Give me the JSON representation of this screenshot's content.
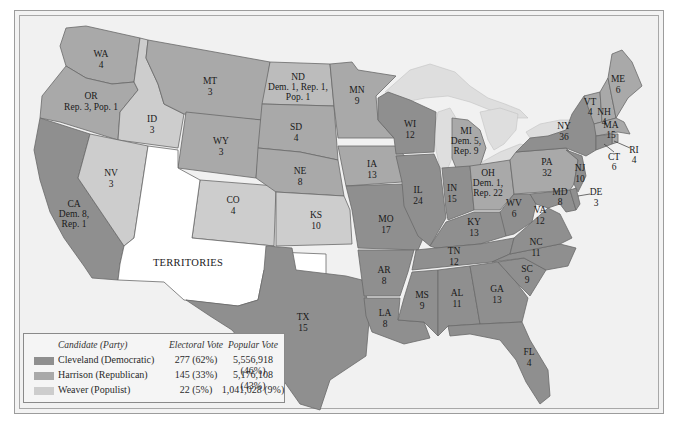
{
  "map": {
    "title": "",
    "territories_label": "TERRITORIES",
    "colors": {
      "democratic": "#8f8f8f",
      "republican": "#a9a9a9",
      "populist": "#cdcdcd",
      "territories": "#ffffff"
    },
    "states": {
      "WA": {
        "abbr": "WA",
        "votes": "4",
        "party": "republican"
      },
      "OR": {
        "abbr": "OR",
        "votes": "Rep. 3, Pop. 1",
        "party": "republican"
      },
      "CA": {
        "abbr": "CA",
        "votes_line1": "Dem. 8,",
        "votes_line2": "Rep. 1",
        "party": "democratic"
      },
      "ID": {
        "abbr": "ID",
        "votes": "3",
        "party": "populist"
      },
      "NV": {
        "abbr": "NV",
        "votes": "3",
        "party": "populist"
      },
      "MT": {
        "abbr": "MT",
        "votes": "3",
        "party": "republican"
      },
      "WY": {
        "abbr": "WY",
        "votes": "3",
        "party": "republican"
      },
      "CO": {
        "abbr": "CO",
        "votes": "4",
        "party": "populist"
      },
      "ND": {
        "abbr": "ND",
        "votes_line1": "Dem. 1, Rep. 1,",
        "votes_line2": "Pop. 1",
        "party": "mixed"
      },
      "SD": {
        "abbr": "SD",
        "votes": "4",
        "party": "republican"
      },
      "NE": {
        "abbr": "NE",
        "votes": "8",
        "party": "republican"
      },
      "KS": {
        "abbr": "KS",
        "votes": "10",
        "party": "populist"
      },
      "TX": {
        "abbr": "TX",
        "votes": "15",
        "party": "democratic"
      },
      "MN": {
        "abbr": "MN",
        "votes": "9",
        "party": "republican"
      },
      "IA": {
        "abbr": "IA",
        "votes": "13",
        "party": "republican"
      },
      "MO": {
        "abbr": "MO",
        "votes": "17",
        "party": "democratic"
      },
      "AR": {
        "abbr": "AR",
        "votes": "8",
        "party": "democratic"
      },
      "LA": {
        "abbr": "LA",
        "votes": "8",
        "party": "democratic"
      },
      "WI": {
        "abbr": "WI",
        "votes": "12",
        "party": "democratic"
      },
      "IL": {
        "abbr": "IL",
        "votes": "24",
        "party": "democratic"
      },
      "MI": {
        "abbr": "MI",
        "votes_line1": "Dem. 5,",
        "votes_line2": "Rep. 9",
        "party": "republican"
      },
      "IN": {
        "abbr": "IN",
        "votes": "15",
        "party": "democratic"
      },
      "OH": {
        "abbr": "OH",
        "votes_line1": "Dem. 1,",
        "votes_line2": "Rep. 22",
        "party": "republican"
      },
      "KY": {
        "abbr": "KY",
        "votes": "13",
        "party": "democratic"
      },
      "TN": {
        "abbr": "TN",
        "votes": "12",
        "party": "democratic"
      },
      "MS": {
        "abbr": "MS",
        "votes": "9",
        "party": "democratic"
      },
      "AL": {
        "abbr": "AL",
        "votes": "11",
        "party": "democratic"
      },
      "GA": {
        "abbr": "GA",
        "votes": "13",
        "party": "democratic"
      },
      "FL": {
        "abbr": "FL",
        "votes": "4",
        "party": "democratic"
      },
      "SC": {
        "abbr": "SC",
        "votes": "9",
        "party": "democratic"
      },
      "NC": {
        "abbr": "NC",
        "votes": "11",
        "party": "democratic"
      },
      "VA": {
        "abbr": "VA",
        "votes": "12",
        "party": "democratic"
      },
      "WV": {
        "abbr": "WV",
        "votes": "6",
        "party": "democratic"
      },
      "MD": {
        "abbr": "MD",
        "votes": "8",
        "party": "democratic"
      },
      "DE": {
        "abbr": "DE",
        "votes": "3",
        "party": "democratic"
      },
      "PA": {
        "abbr": "PA",
        "votes": "32",
        "party": "republican"
      },
      "NJ": {
        "abbr": "NJ",
        "votes": "10",
        "party": "democratic"
      },
      "NY": {
        "abbr": "NY",
        "votes": "36",
        "party": "democratic"
      },
      "VT": {
        "abbr": "VT",
        "votes": "4",
        "party": "republican"
      },
      "NH": {
        "abbr": "NH",
        "votes": "4",
        "party": "republican"
      },
      "ME": {
        "abbr": "ME",
        "votes": "6",
        "party": "republican"
      },
      "MA": {
        "abbr": "MA",
        "votes": "15",
        "party": "republican"
      },
      "RI": {
        "abbr": "RI",
        "votes": "4",
        "party": "republican"
      },
      "CT": {
        "abbr": "CT",
        "votes": "6",
        "party": "democratic"
      }
    }
  },
  "legend": {
    "headers": {
      "candidate": "Candidate (Party)",
      "electoral": "Electoral Vote",
      "popular": "Popular Vote"
    },
    "rows": [
      {
        "candidate": "Cleveland (Democratic)",
        "electoral": "277 (62%)",
        "popular": "5,556,918 (46%)",
        "color": "#8f8f8f"
      },
      {
        "candidate": "Harrison (Republican)",
        "electoral": "145 (33%)",
        "popular": "5,176,108 (43%)",
        "color": "#a9a9a9"
      },
      {
        "candidate": "Weaver (Populist)",
        "electoral": "22 (5%)",
        "popular": "1,041,028 (9%)",
        "color": "#cdcdcd"
      }
    ]
  }
}
